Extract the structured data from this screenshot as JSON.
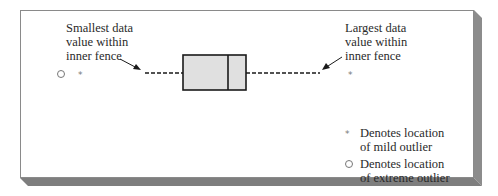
{
  "annotations": {
    "smallest": [
      "Smallest data",
      "value within",
      "inner fence"
    ],
    "largest": [
      "Largest data",
      "value within",
      "inner fence"
    ]
  },
  "legend": {
    "mild": {
      "symbol": "*",
      "lines": [
        "Denotes location",
        "of mild outlier"
      ]
    },
    "extreme": {
      "symbol": "○",
      "lines": [
        "Denotes location",
        "of extreme outlier"
      ]
    }
  },
  "colors": {
    "panel": "#ffffff",
    "shadow": "#8a8a8a",
    "box_fill": "#e0e0e0",
    "stroke": "#1a1a1a"
  }
}
